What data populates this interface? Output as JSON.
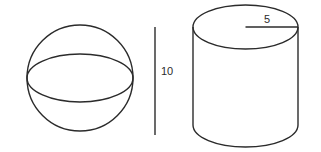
{
  "figure": {
    "sphere": {
      "shape": "sphere",
      "center": [
        80,
        78
      ],
      "radius": 53,
      "equator_ry": 24
    },
    "height_marker": {
      "label": "10",
      "x": 155,
      "y_top": 27,
      "y_bottom": 135
    },
    "cylinder": {
      "shape": "cylinder",
      "center_x": 245.5,
      "rx": 52.5,
      "ry": 22,
      "top_cy": 27,
      "bottom_cy": 125,
      "radius_label": "5"
    },
    "colors": {
      "stroke": "#2b2b2b",
      "background": "#ffffff"
    }
  }
}
